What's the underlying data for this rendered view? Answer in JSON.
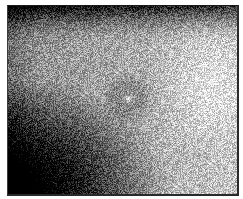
{
  "figure": {
    "panel_label": "",
    "image_description": "Grayscale speckled texture field with dark top band, dark lower-left corner, bright right region, and faint darker ring around a small bright central spot",
    "colors": {
      "dark": "#0a0a0a",
      "mid": "#8c8c8c",
      "bright": "#e6e6e6",
      "border": "#2a2a2a"
    }
  }
}
